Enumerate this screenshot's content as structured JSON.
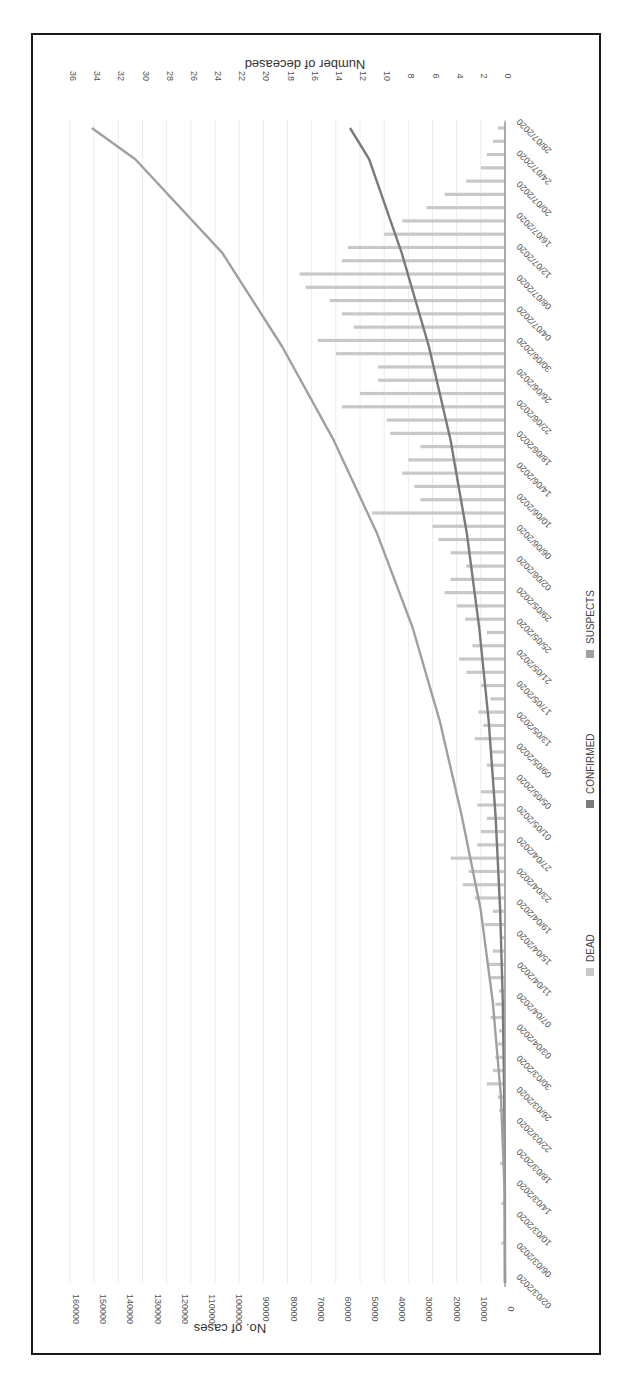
{
  "chart_data": {
    "type": "bar",
    "orientation_note": "figure rendered rotated 90 degrees clockwise",
    "title": "",
    "xlabel": "",
    "ylabel": "No. of cases",
    "ylabel_right": "Number of deceased",
    "ylim": [
      0,
      160000
    ],
    "ylim_right": [
      0,
      36
    ],
    "yticks": [
      0,
      10000,
      20000,
      30000,
      40000,
      50000,
      60000,
      70000,
      80000,
      90000,
      100000,
      110000,
      120000,
      130000,
      140000,
      150000,
      160000
    ],
    "yticks_right": [
      0,
      2,
      4,
      6,
      8,
      10,
      12,
      14,
      16,
      18,
      20,
      22,
      24,
      26,
      28,
      30,
      32,
      34,
      36
    ],
    "x_tick_labels": [
      "02/03/2020",
      "06/03/2020",
      "10/03/2020",
      "14/03/2020",
      "18/03/2020",
      "22/03/2020",
      "26/03/2020",
      "30/03/2020",
      "03/04/2020",
      "07/04/2020",
      "11/04/2020",
      "15/04/2020",
      "19/04/2020",
      "23/04/2020",
      "27/04/2020",
      "01/05/2020",
      "05/05/2020",
      "09/05/2020",
      "13/05/2020",
      "17/05/2020",
      "21/05/2020",
      "25/05/2020",
      "29/05/2020",
      "02/06/2020",
      "06/06/2020",
      "10/06/2020",
      "14/06/2020",
      "18/06/2020",
      "22/06/2020",
      "26/06/2020",
      "30/06/2020",
      "04/07/2020",
      "08/07/2020",
      "12/07/2020",
      "16/07/2020",
      "20/07/2020",
      "24/07/2020",
      "28/07/2020"
    ],
    "grid": true,
    "legend": [
      "DEAD",
      "CONFIRMED",
      "SUSPECTS"
    ],
    "legend_position": "bottom",
    "colors": {
      "DEAD": "#c8c8c8",
      "CONFIRMED": "#7a7a7a",
      "SUSPECTS": "#a0a0a0"
    },
    "series": [
      {
        "name": "DEAD",
        "type": "bar",
        "axis": "right",
        "note": "daily values sampled every 2 days, approximate",
        "values": [
          0,
          0,
          0,
          0.3,
          0,
          0,
          0.3,
          0,
          0,
          0.4,
          0,
          0.2,
          0.3,
          0.5,
          0.6,
          1.5,
          1.0,
          0.8,
          0.6,
          0.5,
          1.2,
          0.8,
          0.5,
          1.2,
          1.5,
          1.0,
          0.4,
          1.7,
          1.0,
          2.5,
          3.5,
          3.0,
          4.5,
          2.3,
          2.0,
          1.5,
          2.3,
          2.0,
          1.0,
          1.5,
          1.2,
          2.5,
          1.8,
          2.2,
          1.2,
          2.0,
          3.2,
          3.8,
          2.7,
          1.5,
          3.3,
          4.0,
          5.0,
          4.5,
          3.2,
          4.5,
          5.5,
          6.0,
          11.0,
          7.0,
          7.5,
          8.5,
          8.0,
          7.0,
          9.5,
          9.8,
          13.5,
          12.0,
          10.5,
          10.5,
          14.0,
          15.5,
          12.5,
          13.5,
          14.5,
          16.5,
          17.0,
          13.5,
          13.0,
          10.0,
          8.5,
          6.5,
          5.0,
          3.2,
          2.0,
          1.5,
          1.0,
          0.6
        ],
        "x_start": "02/03/2020",
        "x_end": "28/07/2020"
      },
      {
        "name": "CONFIRMED",
        "type": "line",
        "axis": "left",
        "x": [
          "02/03/2020",
          "14/03/2020",
          "26/03/2020",
          "07/04/2020",
          "19/04/2020",
          "01/05/2020",
          "13/05/2020",
          "25/05/2020",
          "06/06/2020",
          "18/06/2020",
          "30/06/2020",
          "12/07/2020",
          "24/07/2020",
          "28/07/2020"
        ],
        "values": [
          0,
          50,
          300,
          800,
          1800,
          3500,
          6000,
          9500,
          14000,
          20000,
          28000,
          38000,
          50000,
          57000
        ]
      },
      {
        "name": "SUSPECTS",
        "type": "line",
        "axis": "left",
        "x": [
          "02/03/2020",
          "14/03/2020",
          "26/03/2020",
          "07/04/2020",
          "19/04/2020",
          "01/05/2020",
          "13/05/2020",
          "25/05/2020",
          "06/06/2020",
          "18/06/2020",
          "30/06/2020",
          "12/07/2020",
          "24/07/2020",
          "28/07/2020"
        ],
        "values": [
          0,
          200,
          1500,
          4500,
          9000,
          16000,
          24000,
          34000,
          47000,
          63000,
          82000,
          104000,
          136000,
          152000
        ]
      }
    ]
  }
}
